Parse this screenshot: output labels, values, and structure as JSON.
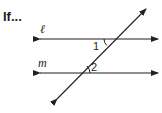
{
  "title": "If...",
  "diagram": {
    "lines": [
      {
        "name": "ℓ",
        "type": "parallel-line"
      },
      {
        "name": "m",
        "type": "parallel-line"
      },
      {
        "name": "transversal",
        "type": "transversal"
      }
    ],
    "angles": [
      {
        "label": "1",
        "position": "below line ℓ, left of transversal"
      },
      {
        "label": "2",
        "position": "above line m, right of transversal"
      }
    ]
  },
  "labels": {
    "line_l": "ℓ",
    "line_m": "m",
    "angle_1": "1",
    "angle_2": "2"
  }
}
